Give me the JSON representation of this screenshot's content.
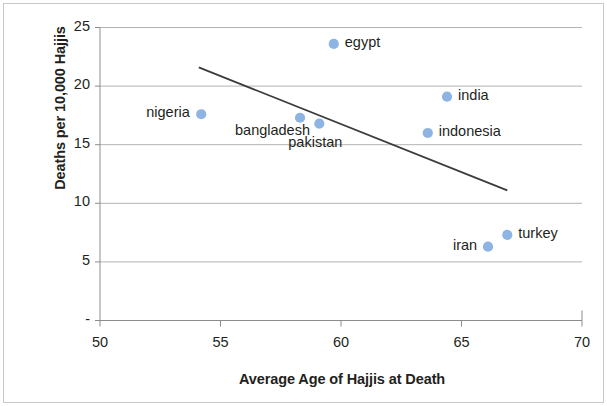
{
  "chart_data": {
    "type": "scatter",
    "title": "",
    "xlabel": "Average Age of Hajjis at Death",
    "ylabel": "Deaths per 10,000 Hajjis",
    "xlim": [
      50,
      70
    ],
    "ylim": [
      0,
      25
    ],
    "xticks": [
      "50",
      "55",
      "60",
      "65",
      "70"
    ],
    "xtick_values": [
      50,
      55,
      60,
      65,
      70
    ],
    "yticks": [
      "-",
      "5",
      "10",
      "15",
      "20",
      "25"
    ],
    "ytick_values": [
      0,
      5,
      10,
      15,
      20,
      25
    ],
    "grid": "horizontal",
    "legend": "none",
    "point_color": "#8db4e2",
    "trendline_color": "#3b3b3b",
    "grid_color": "#b3b3b3",
    "points": [
      {
        "label": "nigeria",
        "x": 54.2,
        "y": 17.6,
        "label_pos": "left"
      },
      {
        "label": "bangladesh",
        "x": 58.3,
        "y": 17.3,
        "label_pos": "below-left"
      },
      {
        "label": "pakistan",
        "x": 59.1,
        "y": 16.8,
        "label_pos": "below"
      },
      {
        "label": "egypt",
        "x": 59.7,
        "y": 23.6,
        "label_pos": "right"
      },
      {
        "label": "indonesia",
        "x": 63.6,
        "y": 16.0,
        "label_pos": "right"
      },
      {
        "label": "india",
        "x": 64.4,
        "y": 19.1,
        "label_pos": "right"
      },
      {
        "label": "iran",
        "x": 66.1,
        "y": 6.3,
        "label_pos": "left"
      },
      {
        "label": "turkey",
        "x": 66.9,
        "y": 7.3,
        "label_pos": "right"
      }
    ],
    "trendline": {
      "x1": 54.1,
      "y1": 21.6,
      "x2": 66.9,
      "y2": 11.1
    }
  }
}
